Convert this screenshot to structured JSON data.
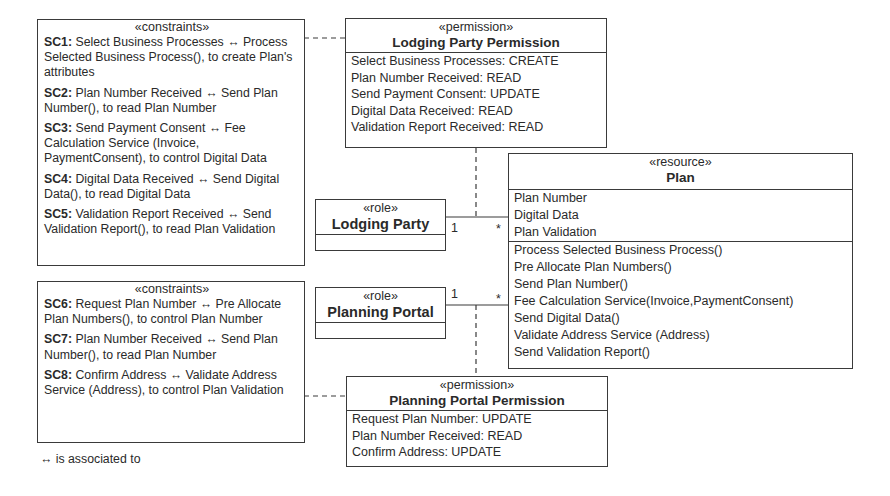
{
  "constraints_top": {
    "stereotype": "«constraints»",
    "items": [
      {
        "id": "SC1:",
        "text": " Select Business Processes ↔ Process Selected Business Process(), to create Plan's attributes"
      },
      {
        "id": "SC2:",
        "text": " Plan Number Received ↔ Send Plan Number(), to read Plan Number"
      },
      {
        "id": "SC3:",
        "text": " Send Payment Consent ↔ Fee Calculation Service (Invoice, PaymentConsent), to control Digital Data"
      },
      {
        "id": "SC4:",
        "text": " Digital Data Received ↔ Send Digital Data(), to read Digital Data"
      },
      {
        "id": "SC5:",
        "text": " Validation Report Received ↔  Send Validation Report(), to read Plan Validation"
      }
    ]
  },
  "constraints_bottom": {
    "stereotype": "«constraints»",
    "items": [
      {
        "id": "SC6:",
        "text": " Request Plan Number ↔ Pre Allocate Plan Numbers(), to control Plan Number"
      },
      {
        "id": "SC7:",
        "text": " Plan Number Received ↔ Send Plan Number(), to read Plan Number"
      },
      {
        "id": "SC8:",
        "text": " Confirm Address ↔ Validate Address Service (Address), to control Plan Validation"
      }
    ]
  },
  "legend": "↔ is associated to",
  "lodging_permission": {
    "stereotype": "«permission»",
    "title": "Lodging Party Permission",
    "entries": [
      "Select Business Processes: CREATE",
      "Plan Number Received: READ",
      "Send Payment Consent: UPDATE",
      "Digital Data Received: READ",
      "Validation Report Received: READ"
    ]
  },
  "planning_permission": {
    "stereotype": "«permission»",
    "title": "Planning Portal Permission",
    "entries": [
      "Request Plan Number: UPDATE",
      "Plan Number Received: READ",
      "Confirm Address: UPDATE"
    ]
  },
  "role_lodging": {
    "stereotype": "«role»",
    "title": "Lodging Party",
    "mult_left": "1",
    "mult_right": "*"
  },
  "role_planning": {
    "stereotype": "«role»",
    "title": "Planning Portal",
    "mult_left": "1",
    "mult_right": "*"
  },
  "resource": {
    "stereotype": "«resource»",
    "title": "Plan",
    "attributes": [
      "Plan Number",
      "Digital Data",
      "Plan Validation"
    ],
    "operations": [
      "Process Selected Business Process()",
      "Pre Allocate Plan Numbers()",
      "Send Plan Number()",
      "Fee Calculation Service(Invoice,PaymentConsent)",
      "Send Digital Data()",
      "Validate Address Service (Address)",
      "Send Validation Report()"
    ]
  }
}
